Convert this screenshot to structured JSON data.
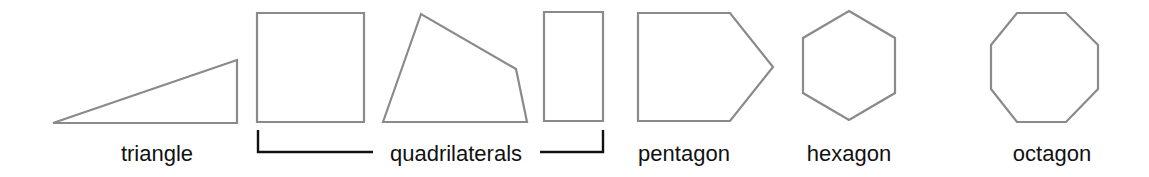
{
  "diagram": {
    "title": "",
    "stroke_color": "#8a8a8a",
    "text_color": "#111111",
    "shapes": [
      {
        "name": "triangle",
        "points": "53,123 237,60 237,123"
      },
      {
        "name": "square",
        "points": "257,13 364,13 364,122 257,122"
      },
      {
        "name": "irregular-quadrilateral",
        "points": "383,122 421,14 516,69 527,122"
      },
      {
        "name": "rectangle",
        "points": "544,12 603,12 603,121 544,121"
      },
      {
        "name": "pentagon",
        "points": "638,13 730,13 773,67 730,121 638,121"
      },
      {
        "name": "hexagon",
        "points": "849,11 895,38 895,93 849,120 803,93 803,38"
      },
      {
        "name": "octagon",
        "points": "1017,13 1066,13 1098,45 1098,89 1066,122 1017,122 991,89 991,45"
      }
    ],
    "labels": {
      "triangle": "triangle",
      "quadrilaterals": "quadrilaterals",
      "pentagon": "pentagon",
      "hexagon": "hexagon",
      "octagon": "octagon"
    },
    "bracket": {
      "left_path": "M258,130 L258,152 L373,152",
      "right_path": "M540,152 L603,152 L603,130"
    }
  }
}
